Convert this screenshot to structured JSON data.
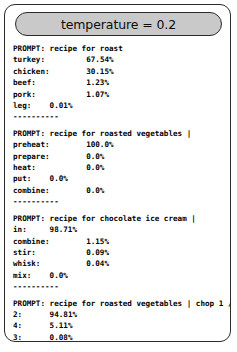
{
  "header": {
    "title": "temperature = 0.2"
  },
  "blocks": [
    {
      "prompt": "PROMPT: recipe for roast",
      "rows": [
        {
          "label": "turkey:",
          "value": "67.54%"
        },
        {
          "label": "chicken:",
          "value": "30.15%"
        },
        {
          "label": "beef:",
          "value": "1.23%"
        },
        {
          "label": "pork:",
          "value": "1.07%"
        },
        {
          "label": "leg:",
          "value": "0.01%"
        }
      ],
      "separator": "----------"
    },
    {
      "prompt": "PROMPT: recipe for roasted vegetables |",
      "rows": [
        {
          "label": "preheat:",
          "value": "100.0%"
        },
        {
          "label": "prepare:",
          "value": "0.0%"
        },
        {
          "label": "heat:",
          "value": "0.0%"
        },
        {
          "label": "put:",
          "value": "0.0%"
        },
        {
          "label": "combine:",
          "value": "0.0%"
        }
      ],
      "separator": "----------"
    },
    {
      "prompt": "PROMPT: recipe for chocolate ice cream |",
      "rows": [
        {
          "label": "in:",
          "value": "98.71%"
        },
        {
          "label": "combine:",
          "value": "1.15%"
        },
        {
          "label": "stir:",
          "value": "0.09%"
        },
        {
          "label": "whisk:",
          "value": "0.04%"
        },
        {
          "label": "mix:",
          "value": "0.0%"
        }
      ],
      "separator": "----------"
    },
    {
      "prompt": "PROMPT: recipe for roasted vegetables | chop 1 /",
      "rows": [
        {
          "label": "2:",
          "value": "94.81%"
        },
        {
          "label": "4:",
          "value": "5.11%"
        },
        {
          "label": "3:",
          "value": "0.08%"
        },
        {
          "label": "8:",
          "value": "0.0%"
        },
        {
          "label": "1:",
          "value": "0.0%"
        }
      ],
      "separator": "----------"
    }
  ],
  "layout": {
    "value_column": 16,
    "short_label_column": 8,
    "short_label_max_len": 4
  }
}
